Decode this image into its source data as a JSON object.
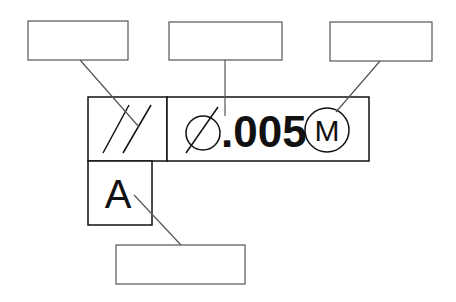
{
  "diagram": {
    "type": "gd&t-feature-control-frame",
    "frame": {
      "characteristic_symbol": "parallelism",
      "diameter_symbol": "⌀",
      "tolerance_value": ".005",
      "material_modifier": "M",
      "datum": "A"
    },
    "label_boxes": [
      {
        "id": "symbol-label",
        "text": ""
      },
      {
        "id": "tolerance-label",
        "text": ""
      },
      {
        "id": "modifier-label",
        "text": ""
      },
      {
        "id": "datum-label",
        "text": ""
      }
    ],
    "colors": {
      "frame": "#111111",
      "leader": "#555555",
      "background": "#ffffff"
    }
  }
}
